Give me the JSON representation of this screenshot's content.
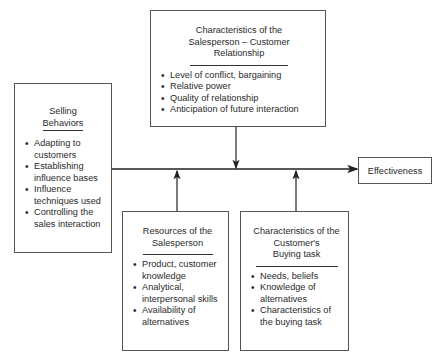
{
  "diagram": {
    "relationship_box": {
      "title_lines": [
        "Characteristics of the",
        "Salesperson – Customer",
        "Relationship"
      ],
      "items": [
        "Level of conflict, bargaining",
        "Relative power",
        "Quality of relationship",
        "Anticipation of future interaction"
      ]
    },
    "selling_box": {
      "title_lines": [
        "Selling",
        "Behaviors"
      ],
      "items": [
        "Adapting to customers",
        "Establishing influence bases",
        "Influence techniques used",
        "Controlling the sales interaction"
      ]
    },
    "resources_box": {
      "title_lines": [
        "Resources of the",
        "Salesperson"
      ],
      "items": [
        "Product, customer knowledge",
        "Analytical, interpersonal skills",
        "Availability of alternatives"
      ]
    },
    "buying_task_box": {
      "title_lines": [
        "Characteristics of the",
        "Customer's",
        "Buying task"
      ],
      "items": [
        "Needs, beliefs",
        "Knowledge of alternatives",
        "Characteristics of the buying task"
      ]
    },
    "outcome_box": {
      "label": "Effectiveness"
    }
  }
}
